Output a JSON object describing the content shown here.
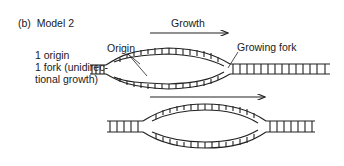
{
  "figure": {
    "panel_label": "(b)",
    "title": "Model 2",
    "description_lines": [
      "1 origin",
      "1 fork (unidirec-",
      "tional growth)"
    ],
    "labels": {
      "growth": "Growth",
      "origin": "Origin",
      "growing_fork": "Growing fork"
    },
    "colors": {
      "line": "#222222",
      "background": "#ffffff"
    }
  }
}
